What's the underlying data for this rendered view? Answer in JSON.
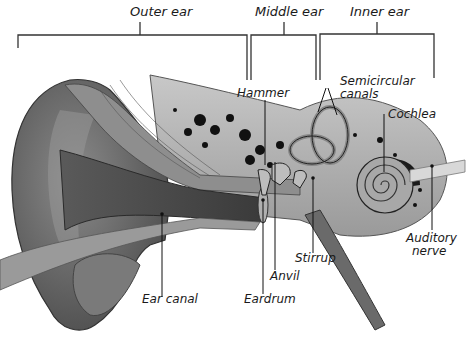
{
  "diagram": {
    "sections": [
      {
        "id": "outer",
        "label": "Outer ear"
      },
      {
        "id": "middle",
        "label": "Middle ear"
      },
      {
        "id": "inner",
        "label": "Inner ear"
      }
    ],
    "parts": {
      "hammer": "Hammer",
      "semicircular_l1": "Semicircular",
      "semicircular_l2": "canals",
      "cochlea": "Cochlea",
      "auditory_l1": "Auditory",
      "auditory_l2": "nerve",
      "stirrup": "Stirrup",
      "anvil": "Anvil",
      "eardrum": "Eardrum",
      "ear_canal": "Ear canal"
    }
  }
}
